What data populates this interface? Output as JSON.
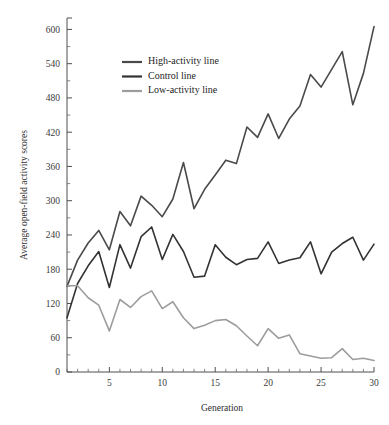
{
  "chart_data": {
    "type": "line",
    "title": "",
    "xlabel": "Generation",
    "ylabel": "Average open-field activity scores",
    "xlim": [
      1,
      30
    ],
    "ylim": [
      0,
      620
    ],
    "xticks": [
      5,
      10,
      15,
      20,
      25,
      30
    ],
    "yticks": [
      0,
      60,
      120,
      180,
      240,
      300,
      360,
      420,
      480,
      540,
      600
    ],
    "ytick_labels": [
      "0",
      "60",
      "120",
      "180",
      "240",
      "300",
      "360",
      "420",
      "480",
      "540",
      "600"
    ],
    "xtick_labels": [
      "5",
      "10",
      "15",
      "20",
      "25",
      "30"
    ],
    "x_minor_step": 1,
    "y_minor_step": 30,
    "grid": false,
    "legend_position": "upper-left-inside",
    "x": [
      1,
      2,
      3,
      4,
      5,
      6,
      7,
      8,
      9,
      10,
      11,
      12,
      13,
      14,
      15,
      16,
      17,
      18,
      19,
      20,
      21,
      22,
      23,
      24,
      25,
      26,
      27,
      28,
      29,
      30
    ],
    "series": [
      {
        "name": "High-activity line",
        "color": "#4a4a4a",
        "values": [
          150,
          196,
          226,
          248,
          214,
          281,
          256,
          308,
          292,
          272,
          303,
          367,
          286,
          320,
          345,
          371,
          365,
          429,
          411,
          452,
          409,
          443,
          466,
          521,
          499,
          530,
          561,
          468,
          523,
          605
        ]
      },
      {
        "name": "Control line",
        "color": "#333333",
        "values": [
          95,
          155,
          186,
          211,
          148,
          223,
          182,
          237,
          254,
          197,
          241,
          211,
          166,
          168,
          223,
          201,
          188,
          197,
          199,
          228,
          190,
          196,
          200,
          228,
          172,
          210,
          225,
          236,
          196,
          224
        ]
      },
      {
        "name": "Low-activity line",
        "color": "#9d9d9d",
        "values": [
          151,
          151,
          130,
          117,
          72,
          127,
          113,
          132,
          142,
          111,
          123,
          95,
          76,
          82,
          90,
          92,
          81,
          63,
          46,
          76,
          59,
          65,
          32,
          28,
          24,
          25,
          41,
          22,
          24,
          20
        ]
      }
    ]
  },
  "legend": {
    "items": [
      {
        "label": "High-activity line",
        "color": "#4a4a4a"
      },
      {
        "label": "Control line",
        "color": "#333333"
      },
      {
        "label": "Low-activity line",
        "color": "#9d9d9d"
      }
    ]
  },
  "axes": {
    "x_title": "Generation",
    "y_title": "Average open-field activity scores"
  }
}
